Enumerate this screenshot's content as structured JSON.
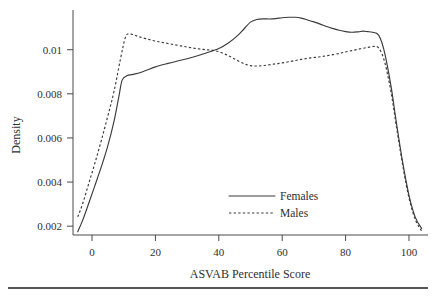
{
  "chart_data": {
    "type": "line",
    "title": "",
    "subtitle": "",
    "xlabel": "ASVAB Percentile Score",
    "ylabel": "Density",
    "xlim": [
      -6,
      106
    ],
    "ylim": [
      0.0016,
      0.0118
    ],
    "xticks": [
      0,
      20,
      40,
      60,
      80,
      100
    ],
    "xtick_labels": [
      "0",
      "20",
      "40",
      "60",
      "80",
      "100"
    ],
    "yticks": [
      0.002,
      0.004,
      0.006,
      0.008,
      0.01
    ],
    "ytick_labels": [
      "0.002",
      "0.004",
      "0.006",
      "0.008",
      "0.01"
    ],
    "grid": false,
    "legend_position": "center-right-lower",
    "legend": [
      {
        "name": "Females",
        "style": "solid"
      },
      {
        "name": "Males",
        "style": "dotted"
      }
    ],
    "series": [
      {
        "name": "Females",
        "style": "solid",
        "x": [
          -4.5,
          -3,
          -1,
          1,
          3,
          5,
          7,
          8.5,
          9.5,
          11,
          13,
          16,
          20,
          24,
          28,
          32,
          36,
          40,
          43,
          46,
          48,
          50,
          52,
          54,
          56,
          58,
          60,
          62,
          64,
          66,
          68,
          70,
          72,
          74,
          76,
          78,
          80,
          82,
          84,
          85.5,
          87,
          88.5,
          90,
          91,
          92,
          93,
          94.5,
          96,
          98,
          100,
          102,
          104
        ],
        "y": [
          0.00175,
          0.00225,
          0.00305,
          0.00388,
          0.00472,
          0.00565,
          0.0068,
          0.0079,
          0.00862,
          0.00882,
          0.00888,
          0.009,
          0.00922,
          0.00938,
          0.00952,
          0.00967,
          0.00985,
          0.01005,
          0.0103,
          0.01065,
          0.01095,
          0.01125,
          0.01137,
          0.0114,
          0.01139,
          0.01141,
          0.01145,
          0.01147,
          0.01147,
          0.01143,
          0.01135,
          0.01126,
          0.01116,
          0.01105,
          0.01096,
          0.01088,
          0.01082,
          0.01079,
          0.01081,
          0.01084,
          0.01082,
          0.01079,
          0.01072,
          0.0105,
          0.01005,
          0.0094,
          0.0082,
          0.00672,
          0.0049,
          0.0034,
          0.0024,
          0.0019
        ]
      },
      {
        "name": "Males",
        "style": "dotted",
        "x": [
          -4.5,
          -3,
          -1,
          1,
          3,
          5,
          7,
          9,
          10.5,
          11.5,
          13,
          15,
          18,
          21,
          24,
          27,
          30,
          33,
          36,
          39,
          42,
          45,
          48,
          50,
          52,
          54,
          56,
          58,
          60,
          63,
          66,
          69,
          72,
          75,
          78,
          80,
          82,
          84,
          86,
          87.5,
          89,
          90,
          91,
          92,
          93,
          94.5,
          96,
          98,
          100,
          102,
          104
        ],
        "y": [
          0.00242,
          0.003,
          0.00395,
          0.0049,
          0.00592,
          0.007,
          0.00815,
          0.0096,
          0.01055,
          0.01072,
          0.01068,
          0.01058,
          0.01046,
          0.01036,
          0.01028,
          0.0102,
          0.01012,
          0.01005,
          0.01,
          0.00995,
          0.0098,
          0.00958,
          0.00936,
          0.00928,
          0.00926,
          0.00928,
          0.00932,
          0.00936,
          0.0094,
          0.00948,
          0.00956,
          0.00963,
          0.00968,
          0.00975,
          0.00983,
          0.0099,
          0.00996,
          0.01002,
          0.01008,
          0.01012,
          0.01015,
          0.01013,
          0.00995,
          0.0096,
          0.00905,
          0.00795,
          0.00655,
          0.00478,
          0.00328,
          0.0023,
          0.00178
        ]
      }
    ],
    "annotations": []
  },
  "figure": {
    "background_color": "#ffffff",
    "line_color": "#3a3a3a",
    "footer_rule_color": "#1d1d1d"
  }
}
